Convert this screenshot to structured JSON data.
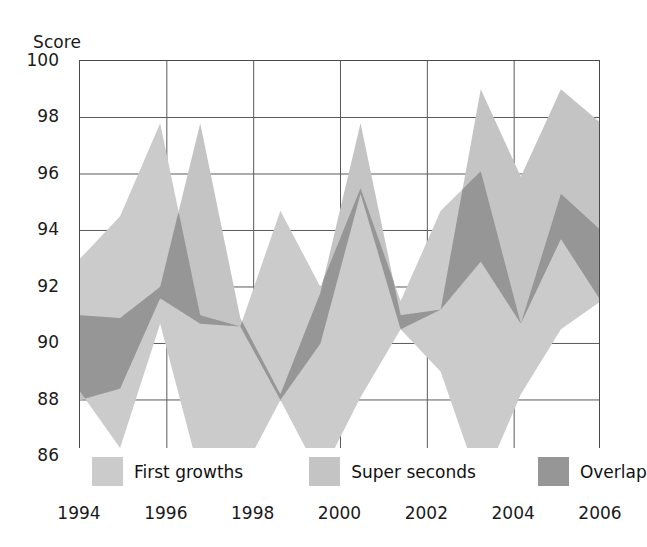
{
  "chart_data": {
    "type": "area",
    "title": "",
    "ylabel": "Score",
    "xlabel": "",
    "ylim": [
      84.6,
      100
    ],
    "xlim": [
      1994,
      2006
    ],
    "grid": true,
    "y_ticks": [
      100,
      98,
      96,
      94,
      92,
      90,
      88,
      86
    ],
    "x_ticks": [
      1994,
      1996,
      1998,
      2000,
      2002,
      2004,
      2006
    ],
    "x": [
      1994,
      1995,
      1996,
      1997,
      1998,
      1999,
      2000,
      2001,
      2002,
      2003,
      2004,
      2005,
      2006
    ],
    "legend_position": "bottom",
    "series": [
      {
        "name": "First growths",
        "color": "#cbcbcb",
        "kind": "band",
        "upper": [
          93.0,
          94.5,
          97.8,
          91.0,
          90.6,
          94.7,
          92.0,
          95.5,
          91.5,
          94.7,
          96.1,
          90.7,
          95.3,
          94.0
        ],
        "lower": [
          88.3,
          86.3,
          90.7,
          85.3,
          85.3,
          88.0,
          85.3,
          88.1,
          90.5,
          89.0,
          84.9,
          88.2,
          90.5,
          91.5
        ]
      },
      {
        "name": "Super seconds",
        "color": "#c4c4c4",
        "kind": "band",
        "upper": [
          91.0,
          90.9,
          92.0,
          97.8,
          90.9,
          88.2,
          91.8,
          97.8,
          91.0,
          91.2,
          99.0,
          95.9,
          99.0,
          97.8
        ],
        "lower": [
          88.0,
          88.4,
          91.6,
          90.7,
          90.6,
          88.0,
          90.0,
          95.3,
          90.5,
          91.2,
          92.9,
          90.7,
          93.7,
          91.5
        ]
      }
    ],
    "overlap": {
      "name": "Overlap",
      "color": "#969696"
    }
  },
  "legend": {
    "items": [
      {
        "label": "First growths",
        "color": "#cbcbcb"
      },
      {
        "label": "Super seconds",
        "color": "#c4c4c4"
      },
      {
        "label": "Overlap",
        "color": "#969696"
      }
    ]
  },
  "axes": {
    "y_title": "Score",
    "y_tick_labels": [
      "100",
      "98",
      "96",
      "94",
      "92",
      "90",
      "88",
      "86"
    ],
    "x_tick_labels": [
      "1994",
      "1996",
      "1998",
      "2000",
      "2002",
      "2004",
      "2006"
    ]
  }
}
